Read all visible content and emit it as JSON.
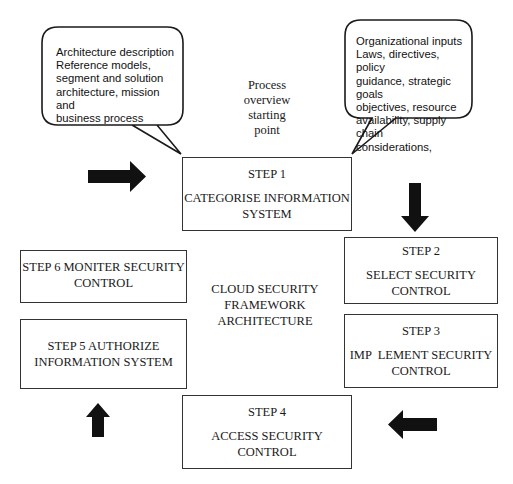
{
  "diagram": {
    "center_label": [
      "CLOUD SECURITY",
      "FRAMEWORK",
      "ARCHITECTURE"
    ],
    "start_note": [
      "Process",
      "overview",
      "starting",
      "point"
    ],
    "callouts": {
      "left": [
        "Architecture description",
        "Reference models,",
        "segment and solution",
        "architecture, mission and",
        "business process"
      ],
      "right": [
        "Organizational inputs",
        "Laws, directives, policy",
        "guidance, strategic goals",
        "objectives, resource",
        "availability, supply chain",
        "considerations,"
      ]
    },
    "steps": [
      {
        "id": "step1",
        "title": "STEP 1",
        "lines": [
          "CATEGORISE INFORMATION",
          "SYSTEM"
        ]
      },
      {
        "id": "step2",
        "title": "STEP 2",
        "lines": [
          "SELECT SECURITY",
          "CONTROL"
        ]
      },
      {
        "id": "step3",
        "title": "STEP 3",
        "lines": [
          "IMP  LEMENT SECURITY",
          "CONTROL"
        ]
      },
      {
        "id": "step4",
        "title": "STEP 4",
        "lines": [
          "ACCESS SECURITY",
          "CONTROL"
        ]
      },
      {
        "id": "step5",
        "title": "",
        "lines": [
          "STEP 5 AUTHORIZE",
          "INFORMATION SYSTEM"
        ]
      },
      {
        "id": "step6",
        "title": "",
        "lines": [
          "STEP 6 MONITER SECURITY",
          "CONTROL"
        ]
      }
    ],
    "arrows": [
      {
        "name": "arrow-right-icon",
        "direction": "right",
        "into": "step1"
      },
      {
        "name": "arrow-down-icon",
        "direction": "down",
        "into": "step2"
      },
      {
        "name": "arrow-left-icon",
        "direction": "left",
        "into": "step4"
      },
      {
        "name": "arrow-up-icon",
        "direction": "up",
        "into": "step5"
      }
    ],
    "colors": {
      "stroke": "#1a1a1a",
      "arrow": "#111111",
      "background": "#ffffff"
    }
  }
}
